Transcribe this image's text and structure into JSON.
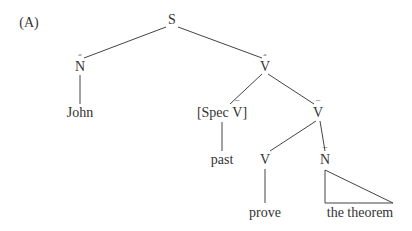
{
  "diagram": {
    "label": "(A)",
    "type": "syntax-tree",
    "nodes": {
      "root": "S",
      "subject_np": {
        "cat": "N",
        "bar": "double"
      },
      "john": "John",
      "vp_top": {
        "cat": "V",
        "bar": "double"
      },
      "spec": {
        "text": "[Spec ",
        "cat": "V",
        "bar": "single",
        "close": "]"
      },
      "vbar": {
        "cat": "V",
        "bar": "single"
      },
      "past": "past",
      "v": "V",
      "nbar": {
        "cat": "N",
        "bar": "single"
      },
      "prove": "prove",
      "the_theorem": "the theorem"
    },
    "marks": {
      "double": "˝",
      "single": "¯"
    },
    "edges": [
      [
        "S",
        "N-double"
      ],
      [
        "S",
        "V-double"
      ],
      [
        "N-double",
        "John"
      ],
      [
        "V-double",
        "[Spec V-bar]"
      ],
      [
        "V-double",
        "V-bar"
      ],
      [
        "[Spec V-bar]",
        "past"
      ],
      [
        "V-bar",
        "V"
      ],
      [
        "V-bar",
        "N-bar"
      ],
      [
        "V",
        "prove"
      ],
      [
        "N-bar",
        "the theorem (triangle)"
      ]
    ],
    "line_color": "#444444"
  }
}
